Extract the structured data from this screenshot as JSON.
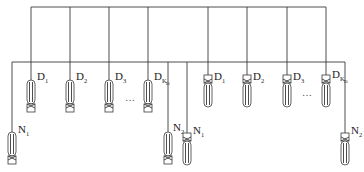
{
  "diagram": {
    "type": "antenna-array-feed-network",
    "top_bus": {
      "x1": 31,
      "x2": 326,
      "y": 7
    },
    "second_bus": {
      "x1": 12,
      "x2": 345,
      "y": 62
    },
    "left_group": {
      "orientation": "oval-top",
      "elements": [
        {
          "label": "D",
          "sub": "1",
          "x": 31
        },
        {
          "label": "D",
          "sub": "2",
          "x": 70
        },
        {
          "label": "D",
          "sub": "3",
          "x": 109
        },
        {
          "label": "D",
          "sub": "K_D",
          "x": 148
        }
      ],
      "ellipsis": "…"
    },
    "right_group": {
      "orientation": "square-top",
      "elements": [
        {
          "label": "D",
          "sub": "1",
          "x": 208
        },
        {
          "label": "D",
          "sub": "2",
          "x": 247
        },
        {
          "label": "D",
          "sub": "3",
          "x": 287
        },
        {
          "label": "D",
          "sub": "K_D",
          "x": 326
        }
      ],
      "ellipsis": "…"
    },
    "n_elements": [
      {
        "label": "N",
        "sub": "1",
        "x": 12,
        "orientation": "oval-top"
      },
      {
        "label": "N",
        "sub": "2",
        "x": 168,
        "orientation": "oval-top"
      },
      {
        "label": "N",
        "sub": "1",
        "x": 187,
        "orientation": "square-top"
      },
      {
        "label": "N",
        "sub": "2",
        "x": 345,
        "orientation": "square-top"
      }
    ]
  }
}
